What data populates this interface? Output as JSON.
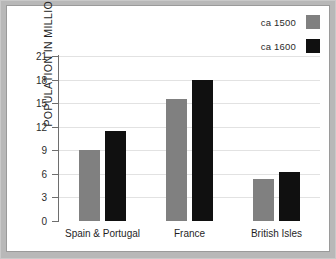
{
  "chart_data": {
    "type": "bar",
    "title": "",
    "xlabel": "",
    "ylabel": "POPULATION IN MILLIONS",
    "categories": [
      "Spain & Portugal",
      "France",
      "British Isles"
    ],
    "series": [
      {
        "name": "ca 1500",
        "color": "#808080",
        "values": [
          9.0,
          15.5,
          5.4
        ]
      },
      {
        "name": "ca 1600",
        "color": "#101010",
        "values": [
          11.5,
          18.0,
          6.2
        ]
      }
    ],
    "ylim": [
      0,
      21
    ],
    "yticks": [
      0,
      3,
      6,
      9,
      12,
      15,
      18,
      21
    ],
    "ytick_labels": [
      "0",
      "3",
      "6",
      "9",
      "12",
      "15",
      "18",
      "21"
    ],
    "grid": true,
    "legend_position": "top-right"
  },
  "legend": {
    "entries": [
      {
        "label": "ca 1500",
        "swatch": "gray-swatch-icon"
      },
      {
        "label": "ca 1600",
        "swatch": "black-swatch-icon"
      }
    ]
  },
  "colors": {
    "series_1": "#808080",
    "series_2": "#101010",
    "frame": "#b8b8b8",
    "grid": "#e2e2e2",
    "axis": "#6e6e6e",
    "plot_background": "#ffffff"
  }
}
